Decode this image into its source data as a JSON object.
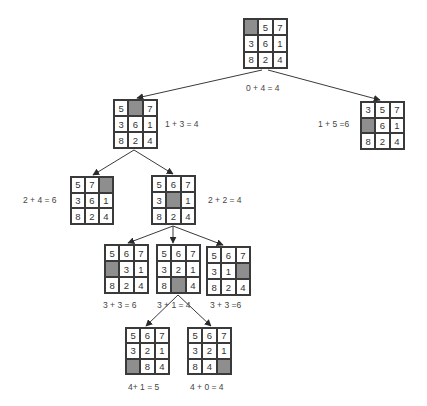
{
  "diagram": {
    "colors": {
      "line": "#3a3a3a",
      "blank_tile": "#8e8e8e",
      "background": "#ffffff"
    },
    "nodes": [
      {
        "id": "root",
        "x": 243,
        "y": 18,
        "w": 45,
        "h": 51,
        "tiles": [
          "",
          "5",
          "7",
          "3",
          "6",
          "1",
          "8",
          "2",
          "4"
        ],
        "label": "0 + 4 = 4",
        "label_x": 246,
        "label_y": 83
      },
      {
        "id": "n1a",
        "x": 113,
        "y": 99,
        "w": 45,
        "h": 50,
        "tiles": [
          "5",
          "",
          "7",
          "3",
          "6",
          "1",
          "8",
          "2",
          "4"
        ],
        "label": "1 + 3 = 4",
        "label_x": 165,
        "label_y": 119
      },
      {
        "id": "n1b",
        "x": 360,
        "y": 101,
        "w": 45,
        "h": 49,
        "tiles": [
          "3",
          "5",
          "7",
          "",
          "6",
          "1",
          "8",
          "2",
          "4"
        ],
        "label": "1 + 5 =6",
        "label_x": 318,
        "label_y": 119
      },
      {
        "id": "n2a",
        "x": 70,
        "y": 176,
        "w": 44,
        "h": 49,
        "tiles": [
          "5",
          "7",
          "",
          "3",
          "6",
          "1",
          "8",
          "2",
          "4"
        ],
        "label": "2 +  4 = 6",
        "label_x": 23,
        "label_y": 195
      },
      {
        "id": "n2b",
        "x": 151,
        "y": 175,
        "w": 45,
        "h": 50,
        "tiles": [
          "5",
          "6",
          "7",
          "3",
          "",
          "1",
          "8",
          "2",
          "4"
        ],
        "label": "2 + 2 = 4",
        "label_x": 208,
        "label_y": 195
      },
      {
        "id": "n3a",
        "x": 104,
        "y": 244,
        "w": 45,
        "h": 50,
        "tiles": [
          "5",
          "6",
          "7",
          "",
          "3",
          "1",
          "8",
          "2",
          "4"
        ],
        "label": "3 +  3 = 6",
        "label_x": 103,
        "label_y": 300
      },
      {
        "id": "n3b",
        "x": 156,
        "y": 244,
        "w": 45,
        "h": 50,
        "tiles": [
          "5",
          "6",
          "7",
          "3",
          "2",
          "1",
          "8",
          "",
          "4"
        ],
        "label": "3 + 1 = 4",
        "label_x": 157,
        "label_y": 300
      },
      {
        "id": "n3c",
        "x": 206,
        "y": 246,
        "w": 45,
        "h": 50,
        "tiles": [
          "5",
          "6",
          "7",
          "3",
          "1",
          "",
          "8",
          "2",
          "4"
        ],
        "label": "3 + 3 =6",
        "label_x": 210,
        "label_y": 300
      },
      {
        "id": "n4a",
        "x": 125,
        "y": 327,
        "w": 45,
        "h": 48,
        "tiles": [
          "5",
          "6",
          "7",
          "3",
          "2",
          "1",
          "",
          "8",
          "4"
        ],
        "label": "4+ 1 = 5",
        "label_x": 128,
        "label_y": 382
      },
      {
        "id": "n4b",
        "x": 187,
        "y": 327,
        "w": 45,
        "h": 48,
        "tiles": [
          "5",
          "6",
          "7",
          "3",
          "2",
          "1",
          "8",
          "4",
          ""
        ],
        "label": "4 + 0 = 4",
        "label_x": 190,
        "label_y": 382
      }
    ],
    "edges": [
      {
        "from": "root",
        "to": "n1a",
        "x1": 262,
        "y1": 70,
        "x2": 137,
        "y2": 98
      },
      {
        "from": "root",
        "to": "n1b",
        "x1": 268,
        "y1": 70,
        "x2": 380,
        "y2": 100
      },
      {
        "from": "n1a",
        "to": "n2a",
        "x1": 134,
        "y1": 150,
        "x2": 93,
        "y2": 175
      },
      {
        "from": "n1a",
        "to": "n2b",
        "x1": 134,
        "y1": 150,
        "x2": 173,
        "y2": 174
      },
      {
        "from": "n2b",
        "to": "n3a",
        "x1": 173,
        "y1": 226,
        "x2": 128,
        "y2": 243
      },
      {
        "from": "n2b",
        "to": "n3b",
        "x1": 173,
        "y1": 226,
        "x2": 173,
        "y2": 243
      },
      {
        "from": "n2b",
        "to": "n3c",
        "x1": 173,
        "y1": 226,
        "x2": 223,
        "y2": 245
      },
      {
        "from": "n3b",
        "to": "n4a",
        "x1": 178,
        "y1": 295,
        "x2": 146,
        "y2": 326
      },
      {
        "from": "n3b",
        "to": "n4b",
        "x1": 178,
        "y1": 295,
        "x2": 211,
        "y2": 326
      }
    ]
  }
}
